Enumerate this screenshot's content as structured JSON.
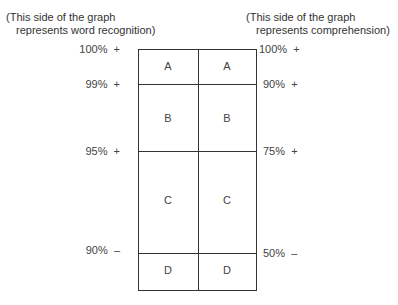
{
  "notes": {
    "left": {
      "line1": "(This side of the graph",
      "line2": "represents word recognition)"
    },
    "right": {
      "line1": "(This side of the graph",
      "line2": "represents comprehension)"
    }
  },
  "left_ticks": [
    {
      "label": "100%",
      "mark": "+"
    },
    {
      "label": "99%",
      "mark": "+"
    },
    {
      "label": "95%",
      "mark": "+"
    },
    {
      "label": "90%",
      "mark": "–"
    }
  ],
  "right_ticks": [
    {
      "label": "100%",
      "mark": "+"
    },
    {
      "label": "90%",
      "mark": "+"
    },
    {
      "label": "75%",
      "mark": "+"
    },
    {
      "label": "50%",
      "mark": "–"
    }
  ],
  "rows": [
    {
      "left": "A",
      "right": "A"
    },
    {
      "left": "B",
      "right": "B"
    },
    {
      "left": "C",
      "right": "C"
    },
    {
      "left": "D",
      "right": "D"
    }
  ]
}
